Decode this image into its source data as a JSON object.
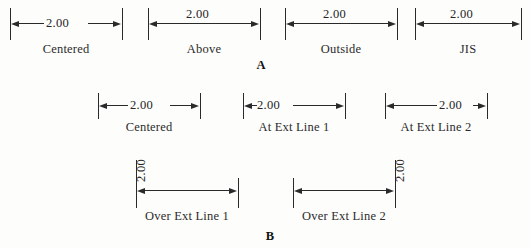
{
  "figure": {
    "top_cut_text": "",
    "panel_a_letter": "A",
    "panel_b_letter": "B"
  },
  "panel_a": {
    "groups": [
      {
        "label": "Centered",
        "value": "2.00"
      },
      {
        "label": "Above",
        "value": "2.00"
      },
      {
        "label": "Outside",
        "value": "2.00"
      },
      {
        "label": "JIS",
        "value": "2.00"
      }
    ]
  },
  "panel_b": {
    "row1": [
      {
        "label": "Centered",
        "value": "2.00"
      },
      {
        "label": "At Ext Line 1",
        "value": "2.00"
      },
      {
        "label": "At Ext Line 2",
        "value": "2.00"
      }
    ],
    "row2": [
      {
        "label": "Over Ext Line 1",
        "value": "2.00"
      },
      {
        "label": "Over Ext Line 2",
        "value": "2.00"
      }
    ]
  },
  "colors": {
    "line": "#2a2a2a",
    "text": "#242424",
    "background": "#fdfdfc"
  }
}
